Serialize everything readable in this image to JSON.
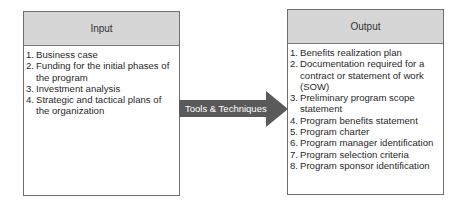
{
  "input": {
    "title": "Input",
    "items": [
      {
        "num": "1.",
        "text": "Business case"
      },
      {
        "num": "2.",
        "text": "Funding for the initial phases of the program"
      },
      {
        "num": "3.",
        "text": "Investment analysis"
      },
      {
        "num": "4.",
        "text": "Strategic and tactical plans of the organization"
      }
    ]
  },
  "arrow": {
    "label": "Tools & Techniques",
    "color": "#5a5a5a"
  },
  "output": {
    "title": "Output",
    "items": [
      {
        "num": "1.",
        "text": "Benefits realization plan"
      },
      {
        "num": "2.",
        "text": "Documentation required for a contract or statement of work (SOW)"
      },
      {
        "num": "3.",
        "text": "Preliminary program scope statement"
      },
      {
        "num": "4.",
        "text": "Program benefits statement"
      },
      {
        "num": "5.",
        "text": "Program charter"
      },
      {
        "num": "6.",
        "text": "Program manager identification"
      },
      {
        "num": "7.",
        "text": "Program selection criteria"
      },
      {
        "num": "8.",
        "text": "Program sponsor identification"
      }
    ]
  }
}
